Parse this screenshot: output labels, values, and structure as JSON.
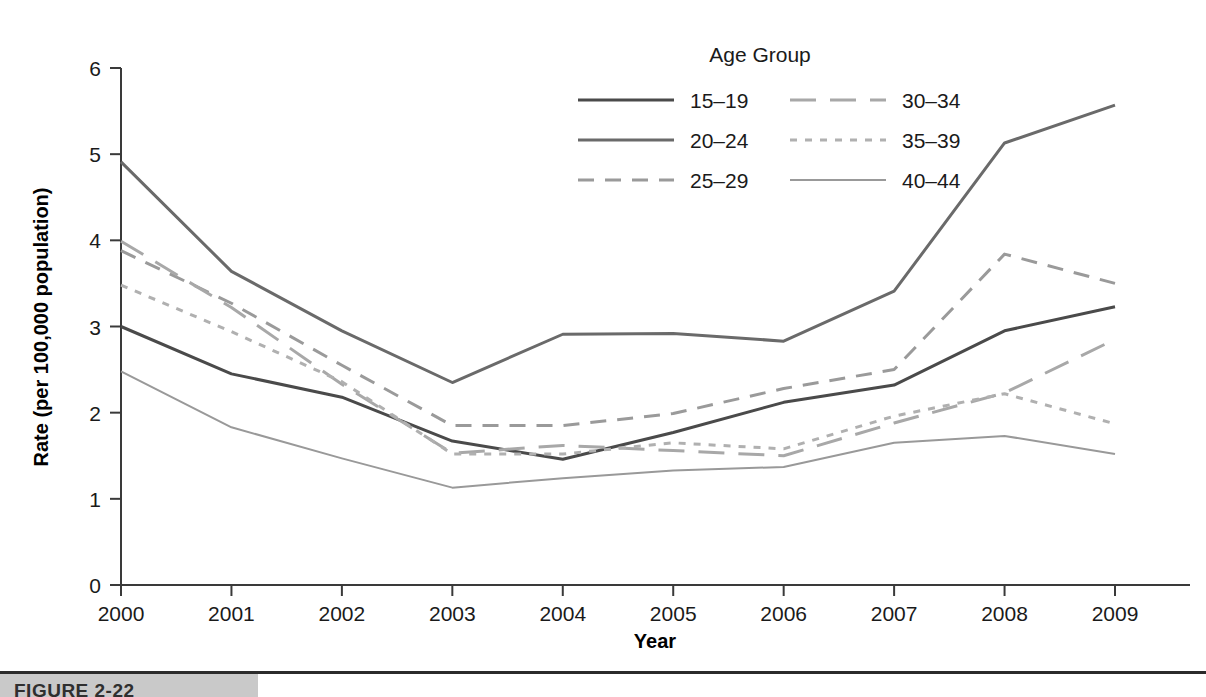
{
  "chart_data": {
    "type": "line",
    "title": "",
    "xlabel": "Year",
    "ylabel": "Rate (per 100,000 population)",
    "x": [
      2000,
      2001,
      2002,
      2003,
      2004,
      2005,
      2006,
      2007,
      2008,
      2009
    ],
    "xtick_labels": [
      "2000",
      "2001",
      "2002",
      "2003",
      "2004",
      "2005",
      "2006",
      "2007",
      "2008",
      "2009"
    ],
    "ytick_labels": [
      "0",
      "1",
      "2",
      "3",
      "4",
      "5",
      "6"
    ],
    "yticks": [
      0,
      1,
      2,
      3,
      4,
      5,
      6
    ],
    "xlim": [
      2000,
      2009
    ],
    "ylim": [
      0,
      6
    ],
    "grid": false,
    "legend_position": "top-right-inside",
    "legend_title": "Age Group",
    "series": [
      {
        "name": "15–19",
        "values": [
          3.0,
          2.45,
          2.18,
          1.67,
          1.46,
          1.77,
          2.12,
          2.32,
          2.95,
          3.23
        ],
        "style": "solid",
        "color": "#4a4a4a",
        "width": 3.0,
        "dash": ""
      },
      {
        "name": "20–24",
        "values": [
          4.91,
          3.64,
          2.95,
          2.35,
          2.91,
          2.92,
          2.83,
          3.41,
          5.13,
          5.57
        ],
        "style": "solid",
        "color": "#6a6a6a",
        "width": 3.0,
        "dash": ""
      },
      {
        "name": "25–29",
        "values": [
          3.88,
          3.27,
          2.55,
          1.85,
          1.85,
          1.99,
          2.28,
          2.5,
          3.84,
          3.5
        ],
        "style": "dashed",
        "color": "#9a9a9a",
        "width": 3.0,
        "dash": "16,11"
      },
      {
        "name": "30–34",
        "values": [
          3.99,
          3.22,
          2.33,
          1.53,
          1.62,
          1.56,
          1.5,
          1.88,
          2.23,
          2.85
        ],
        "style": "long-dash",
        "color": "#a8a8a8",
        "width": 3.0,
        "dash": "26,14"
      },
      {
        "name": "35–39",
        "values": [
          3.48,
          2.94,
          2.36,
          1.52,
          1.52,
          1.65,
          1.58,
          1.96,
          2.22,
          1.87
        ],
        "style": "dotted",
        "color": "#b0b0b0",
        "width": 3.0,
        "dash": "7,8"
      },
      {
        "name": "40–44",
        "values": [
          2.48,
          1.83,
          1.47,
          1.13,
          1.24,
          1.33,
          1.37,
          1.65,
          1.73,
          1.52
        ],
        "style": "solid",
        "color": "#999999",
        "width": 2.0,
        "dash": ""
      }
    ]
  },
  "legend": {
    "title": "Age Group",
    "entries": [
      {
        "label": "15–19",
        "column": 0,
        "row": 0
      },
      {
        "label": "20–24",
        "column": 0,
        "row": 1
      },
      {
        "label": "25–29",
        "column": 0,
        "row": 2
      },
      {
        "label": "30–34",
        "column": 1,
        "row": 0
      },
      {
        "label": "35–39",
        "column": 1,
        "row": 1
      },
      {
        "label": "40–44",
        "column": 1,
        "row": 2
      }
    ]
  },
  "axes": {
    "x_title": "Year",
    "y_title": "Rate (per 100,000 population)"
  },
  "caption": {
    "text": "FIGURE 2-22"
  },
  "colors": {
    "axis": "#3a3a3a",
    "text": "#1a1a1a",
    "background": "#ffffff",
    "caption_band": "#c9c9c9",
    "caption_rule": "#2b2b2b"
  }
}
